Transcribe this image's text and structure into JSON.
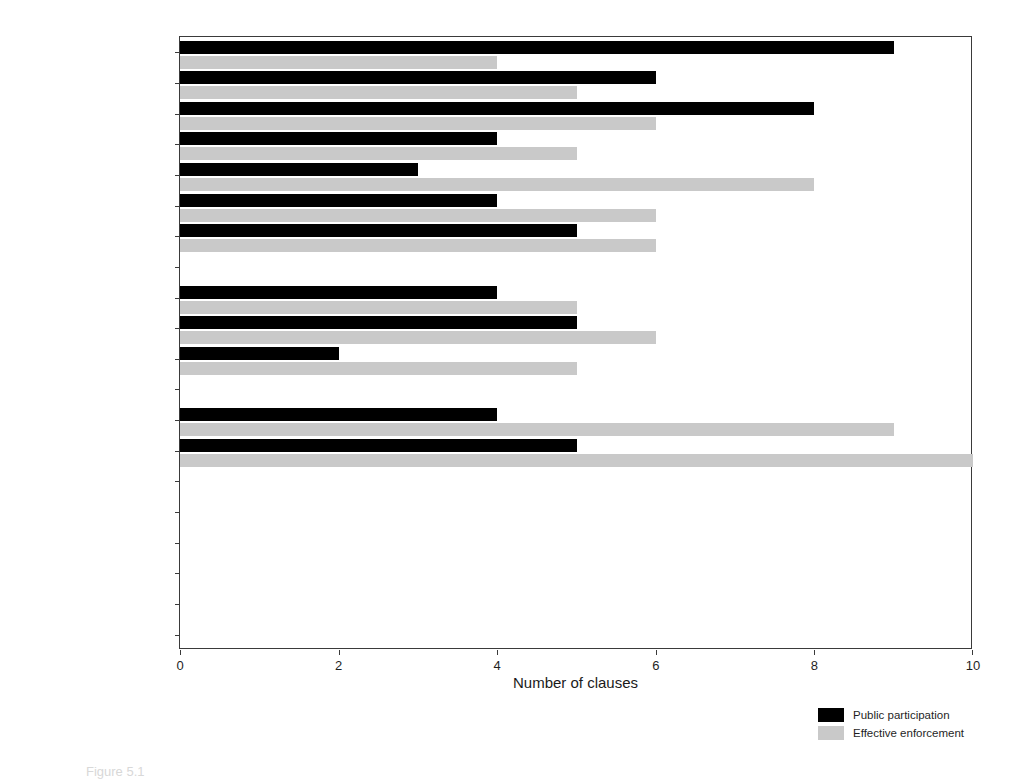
{
  "chart_data": {
    "type": "bar",
    "orientation": "horizontal",
    "title": "",
    "xlabel": "Number of clauses",
    "ylabel": "",
    "xlim": [
      0,
      10
    ],
    "xticks": [
      0,
      2,
      4,
      6,
      8,
      10
    ],
    "xticklabels": [
      "0",
      "2",
      "4",
      "6",
      "8",
      "10"
    ],
    "grid": false,
    "legend_position": "bottom-right",
    "categories": [
      "European Union 2016",
      "Ukraine 2016",
      "TPP 2016",
      "Korea 2014",
      "Honduras 2013",
      "Panama 2010",
      "Jordan 2009",
      "EFTA 2008",
      "Colombia 2008",
      "Peru 2008",
      "Costa Rica 2001",
      "Israel 1996",
      "Chile 1996",
      "NAFTA 1992",
      "United States 1988",
      "New Zealand 1981",
      "APTA 1965",
      "Australia 1960",
      "Spain 1954",
      "Portugal 1954"
    ],
    "series": [
      {
        "name": "Public participation",
        "color": "#000000",
        "values": [
          9,
          6,
          8,
          4,
          3,
          4,
          5,
          0,
          4,
          5,
          2,
          0,
          4,
          5,
          0,
          0,
          0,
          0,
          0,
          0
        ]
      },
      {
        "name": "Effective enforcement",
        "color": "#c9c9c9",
        "values": [
          4,
          5,
          6,
          5,
          8,
          6,
          6,
          0,
          5,
          6,
          5,
          0,
          9,
          10,
          0,
          0,
          0,
          0,
          0,
          0
        ]
      }
    ]
  },
  "caption": {
    "text": "Figure 5.1"
  }
}
